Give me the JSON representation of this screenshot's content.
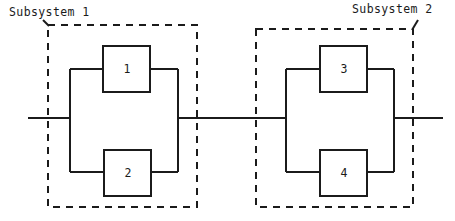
{
  "diagram": {
    "type": "reliability-block-diagram",
    "colors": {
      "line": "#1b1b1b",
      "background": "#ffffff",
      "text": "#1b1b1b"
    },
    "subsystems": [
      {
        "id": "subsystem-1",
        "label": "Subsystem 1",
        "boundary": {
          "x": 48,
          "y": 25,
          "width": 149,
          "height": 182,
          "style": "dashed"
        },
        "components": [
          "1",
          "2"
        ],
        "arrangement": "parallel"
      },
      {
        "id": "subsystem-2",
        "label": "Subsystem 2",
        "boundary": {
          "x": 256,
          "y": 29,
          "width": 157,
          "height": 178,
          "style": "dashed"
        },
        "components": [
          "3",
          "4"
        ],
        "arrangement": "parallel"
      }
    ],
    "blocks": [
      {
        "id": "block-1",
        "label": "1",
        "x": 103,
        "y": 46,
        "width": 47,
        "height": 46,
        "subsystem": "subsystem-1",
        "branch": "upper"
      },
      {
        "id": "block-2",
        "label": "2",
        "x": 104,
        "y": 150,
        "width": 47,
        "height": 46,
        "subsystem": "subsystem-1",
        "branch": "lower"
      },
      {
        "id": "block-3",
        "label": "3",
        "x": 320,
        "y": 46,
        "width": 47,
        "height": 46,
        "subsystem": "subsystem-2",
        "branch": "upper"
      },
      {
        "id": "block-4",
        "label": "4",
        "x": 320,
        "y": 150,
        "width": 47,
        "height": 46,
        "subsystem": "subsystem-2",
        "branch": "lower"
      }
    ],
    "main_line": {
      "y": 118,
      "x_start": 28,
      "x_end": 443
    },
    "series_connection": {
      "from": "subsystem-1",
      "to": "subsystem-2",
      "x_start": 178,
      "x_end": 286
    }
  }
}
